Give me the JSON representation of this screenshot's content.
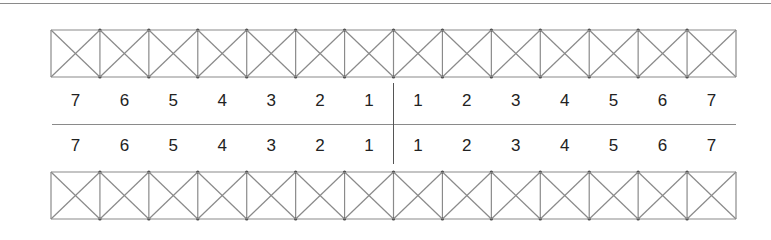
{
  "diagram": {
    "cells_per_strip": 14,
    "line_color": "#8a8a8a",
    "text_color": "#222222",
    "rows": [
      {
        "name": "upper",
        "labels": [
          "7",
          "6",
          "5",
          "4",
          "3",
          "2",
          "1",
          "1",
          "2",
          "3",
          "4",
          "5",
          "6",
          "7"
        ]
      },
      {
        "name": "lower",
        "labels": [
          "7",
          "6",
          "5",
          "4",
          "3",
          "2",
          "1",
          "1",
          "2",
          "3",
          "4",
          "5",
          "6",
          "7"
        ]
      }
    ]
  }
}
